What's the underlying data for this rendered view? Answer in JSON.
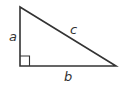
{
  "diagram": {
    "type": "right-triangle",
    "labels": {
      "a": "a",
      "b": "b",
      "c": "c"
    },
    "stroke_color": "#333333",
    "right_angle_marker": true
  }
}
